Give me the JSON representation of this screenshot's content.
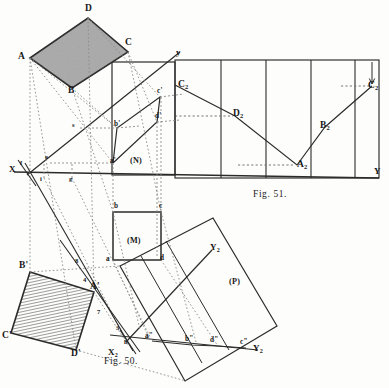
{
  "plate": {
    "background_color": "#fdfdfb",
    "ink_color": "#2b2b2b",
    "fill_gray": "#a9a9a9",
    "width": 389,
    "height": 388
  },
  "figures": [
    {
      "id": "fig50",
      "caption": "F",
      "caption_small": "IG",
      "caption_rest": ". 50."
    },
    {
      "id": "fig51",
      "caption": "F",
      "caption_small": "IG",
      "caption_rest": ". 51."
    }
  ],
  "captions": {
    "fig50": "Fig. 50.",
    "fig51": "Fig. 51."
  },
  "fig50": {
    "region_labels": {
      "n": "(N)",
      "m": "(M)",
      "p": "(P)"
    },
    "axes": {
      "x": "X",
      "y": "y",
      "y_right": "Y",
      "x2": "X",
      "x2_sub": "2",
      "y2_upper": "Y",
      "y2_upper_sub": "2",
      "y2_lower": "Y",
      "y2_lower_sub": "2"
    },
    "top_rhombus": {
      "name": "ABCD",
      "vertices": [
        {
          "label": "A",
          "x": 22,
          "y": 58
        },
        {
          "label": "D",
          "x": 88,
          "y": 11
        },
        {
          "label": "C",
          "x": 128,
          "y": 44
        },
        {
          "label": "B",
          "x": 72,
          "y": 91
        }
      ]
    },
    "bottom_rhombus": {
      "name": "A'B'C'D'",
      "vertices": [
        {
          "label": "B'",
          "x": 22,
          "y": 267
        },
        {
          "label": "A'",
          "x": 93,
          "y": 288
        },
        {
          "label": "D'",
          "x": 73,
          "y": 353
        },
        {
          "label": "C'",
          "x": 5,
          "y": 336
        }
      ]
    },
    "square_m": {
      "vertices": [
        {
          "label": "b",
          "x": 116,
          "y": 207
        },
        {
          "label": "c",
          "x": 162,
          "y": 207
        },
        {
          "label": "d",
          "x": 162,
          "y": 258
        },
        {
          "label": "a",
          "x": 114,
          "y": 260
        }
      ]
    },
    "primary_projection": [
      {
        "label": "a'",
        "x": 113,
        "y": 159
      },
      {
        "label": "b'",
        "x": 116,
        "y": 124
      },
      {
        "label": "c'",
        "x": 160,
        "y": 93
      },
      {
        "label": "d'",
        "x": 159,
        "y": 118
      }
    ],
    "aux_projection": [
      {
        "label": "a\"",
        "x": 148,
        "y": 338
      },
      {
        "label": "b\"",
        "x": 188,
        "y": 342
      },
      {
        "label": "d\"",
        "x": 213,
        "y": 343
      },
      {
        "label": "c\"",
        "x": 243,
        "y": 345
      }
    ],
    "trace_points": [
      {
        "label": "f",
        "x": 21,
        "y": 167
      },
      {
        "label": "i",
        "x": 41,
        "y": 178
      },
      {
        "label": "g",
        "x": 70,
        "y": 178
      },
      {
        "label": "s",
        "x": 74,
        "y": 127
      },
      {
        "label": "e",
        "x": 48,
        "y": 158
      },
      {
        "label": "h",
        "x": 127,
        "y": 343
      },
      {
        "label": "3",
        "x": 119,
        "y": 330
      },
      {
        "label": "7",
        "x": 100,
        "y": 314
      },
      {
        "label": "4",
        "x": 85,
        "y": 281
      },
      {
        "label": "8",
        "x": 77,
        "y": 262
      }
    ]
  },
  "fig51": {
    "panel_dividers_x": [
      175,
      221,
      266,
      311,
      355,
      379
    ],
    "baseline_y": 178,
    "top_y": 60,
    "y_axis_label": "Y",
    "points": [
      {
        "label": "C",
        "sub": "2",
        "x": 183,
        "y": 87
      },
      {
        "label": "D",
        "sub": "2",
        "x": 235,
        "y": 116
      },
      {
        "label": "A",
        "sub": "2",
        "x": 297,
        "y": 165
      },
      {
        "label": "B",
        "sub": "2",
        "x": 325,
        "y": 127
      },
      {
        "label": "C",
        "sub": "2",
        "x": 372,
        "y": 88
      }
    ],
    "polyline": "true-length development of edges",
    "dotted_leaders": [
      {
        "from_x": 175,
        "to_x": 235,
        "y": 116
      },
      {
        "from_x": 236,
        "to_x": 296,
        "y": 165
      },
      {
        "from_x": 341,
        "to_x": 372,
        "y": 88
      }
    ]
  }
}
